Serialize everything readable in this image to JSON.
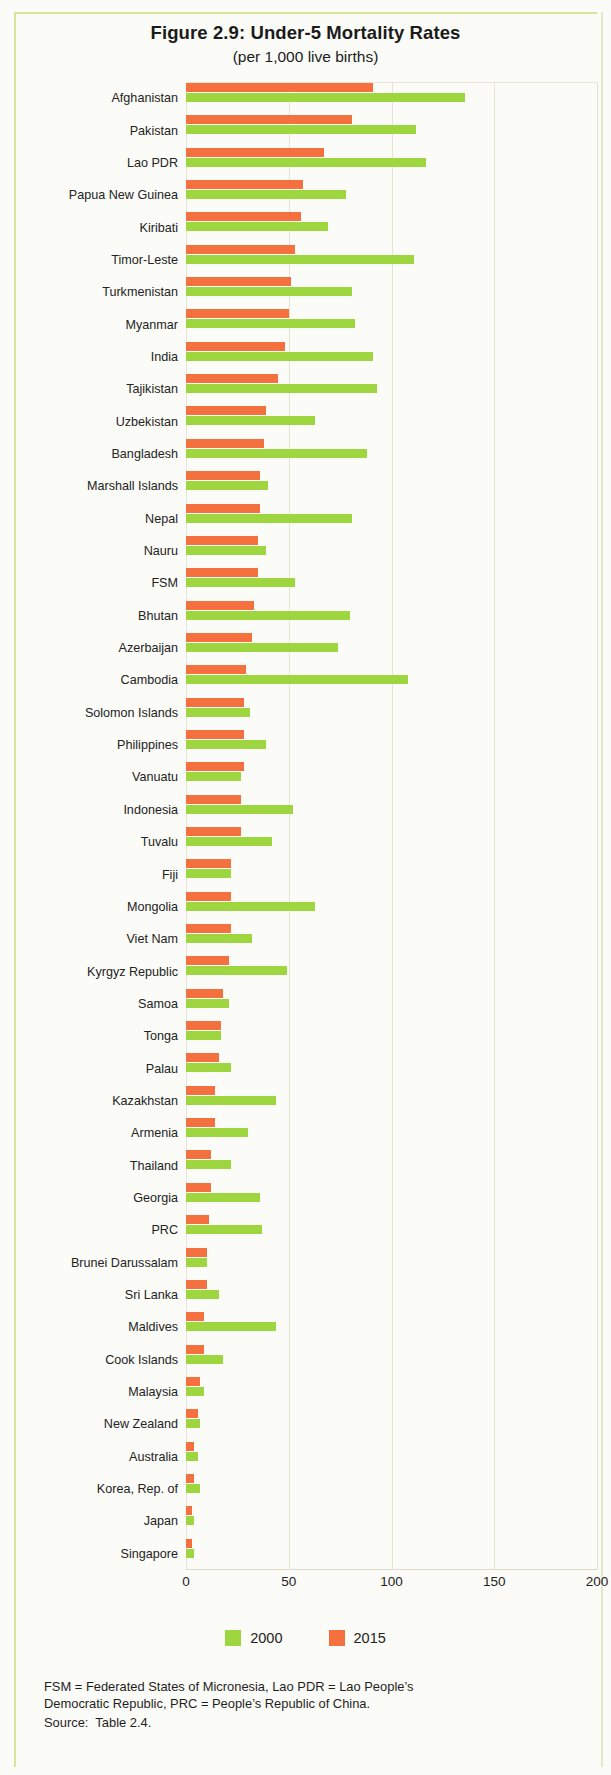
{
  "figure": {
    "title": "Figure 2.9:  Under-5 Mortality Rates",
    "subtitle": "(per 1,000 live births)"
  },
  "legend": {
    "items": [
      {
        "label": "2000",
        "color": "#9ed640"
      },
      {
        "label": "2015",
        "color": "#f4713f"
      }
    ]
  },
  "footnote": {
    "line1": "FSM = Federated States of Micronesia, Lao PDR = Lao People’s",
    "line2": "Democratic Republic, PRC = People’s Republic of China.",
    "source": "Source:  Table 2.4."
  },
  "chart_data": {
    "type": "bar",
    "orientation": "horizontal",
    "title": "Figure 2.9:  Under-5 Mortality Rates",
    "subtitle": "(per 1,000 live births)",
    "xlabel": "",
    "ylabel": "",
    "xlim": [
      0,
      200
    ],
    "xticks": [
      0,
      50,
      100,
      150,
      200
    ],
    "grid": true,
    "legend_position": "bottom",
    "categories": [
      "Afghanistan",
      "Pakistan",
      "Lao PDR",
      "Papua New Guinea",
      "Kiribati",
      "Timor-Leste",
      "Turkmenistan",
      "Myanmar",
      "India",
      "Tajikistan",
      "Uzbekistan",
      "Bangladesh",
      "Marshall Islands",
      "Nepal",
      "Nauru",
      "FSM",
      "Bhutan",
      "Azerbaijan",
      "Cambodia",
      "Solomon Islands",
      "Philippines",
      "Vanuatu",
      "Indonesia",
      "Tuvalu",
      "Fiji",
      "Mongolia",
      "Viet Nam",
      "Kyrgyz Republic",
      "Samoa",
      "Tonga",
      "Palau",
      "Kazakhstan",
      "Armenia",
      "Thailand",
      "Georgia",
      "PRC",
      "Brunei Darussalam",
      "Sri Lanka",
      "Maldives",
      "Cook Islands",
      "Malaysia",
      "New Zealand",
      "Australia",
      "Korea, Rep. of",
      "Japan",
      "Singapore"
    ],
    "series": [
      {
        "name": "2000",
        "color": "#9ed640",
        "values": [
          136,
          112,
          117,
          78,
          69,
          111,
          81,
          82,
          91,
          93,
          63,
          88,
          40,
          81,
          39,
          53,
          80,
          74,
          108,
          31,
          39,
          27,
          52,
          42,
          22,
          63,
          32,
          49,
          21,
          17,
          22,
          44,
          30,
          22,
          36,
          37,
          10,
          16,
          44,
          18,
          9,
          7,
          6,
          7,
          4,
          4
        ]
      },
      {
        "name": "2015",
        "color": "#f4713f",
        "values": [
          91,
          81,
          67,
          57,
          56,
          53,
          51,
          50,
          48,
          45,
          39,
          38,
          36,
          36,
          35,
          35,
          33,
          32,
          29,
          28,
          28,
          28,
          27,
          27,
          22,
          22,
          22,
          21,
          18,
          17,
          16,
          14,
          14,
          12,
          12,
          11,
          10,
          10,
          9,
          9,
          7,
          6,
          4,
          4,
          3,
          3
        ]
      }
    ]
  },
  "xaxis": {
    "ticks": [
      "0",
      "50",
      "100",
      "150",
      "200"
    ],
    "values": [
      0,
      50,
      100,
      150,
      200
    ]
  }
}
